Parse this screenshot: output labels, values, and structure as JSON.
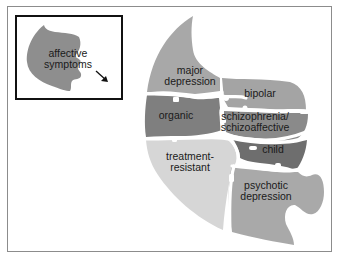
{
  "figure": {
    "inset": {
      "piece_label_line1": "affective",
      "piece_label_line2": "symptoms",
      "arrow_icon": "arrow-down-right"
    },
    "regions": [
      {
        "id": "major-depression",
        "line1": "major",
        "line2": "depression",
        "color": "#a8a8a8"
      },
      {
        "id": "bipolar",
        "line1": "bipolar",
        "line2": "",
        "color": "#a4a4a4"
      },
      {
        "id": "organic",
        "line1": "organic",
        "line2": "",
        "color": "#7f7f7f"
      },
      {
        "id": "schizophrenia",
        "line1": "schizophrenia/",
        "line2": "schizoaffective",
        "color": "#8a8a8a"
      },
      {
        "id": "child",
        "line1": "child",
        "line2": "",
        "color": "#6e6e6e"
      },
      {
        "id": "treatment-resistant",
        "line1": "treatment-",
        "line2": "resistant",
        "color": "#d6d6d6"
      },
      {
        "id": "psychotic-depression",
        "line1": "psychotic",
        "line2": "depression",
        "color": "#a9a9a9"
      }
    ],
    "colors": {
      "affective": "#8e8e8e",
      "separator": "#ffffff",
      "frame": "#8c8c8c",
      "inset_border": "#111111"
    }
  }
}
